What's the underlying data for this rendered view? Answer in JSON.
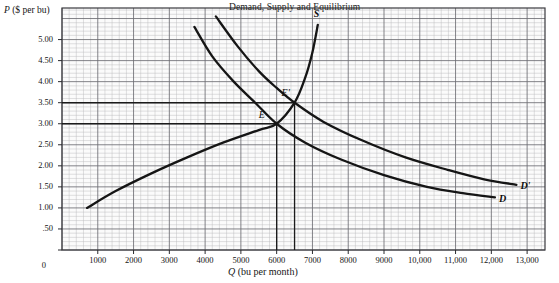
{
  "figure": {
    "title": "Demand, Supply and Equilibrium",
    "background": "#ffffff",
    "grid_fill": "#fbfbfb",
    "grid_minor_color": "#b9b9bd",
    "grid_major_color": "#6d6d72",
    "curve_color": "#151515"
  },
  "chart_data": {
    "type": "line",
    "title": "Demand, Supply and Equilibrium",
    "xlabel": "Q (bu per month)",
    "ylabel": "P ($ per bu)",
    "xlim": [
      0,
      13500
    ],
    "ylim": [
      0,
      5.75
    ],
    "grid": true,
    "legend": "inline-curve-labels",
    "x_ticks": [
      "1000",
      "2000",
      "3000",
      "4000",
      "5000",
      "6000",
      "7000",
      "8000",
      "9000",
      "10,000",
      "11,000",
      "12,000",
      "13,000"
    ],
    "x_tick_values": [
      1000,
      2000,
      3000,
      4000,
      5000,
      6000,
      7000,
      8000,
      9000,
      10000,
      11000,
      12000,
      13000
    ],
    "y_ticks": [
      "0",
      ".50",
      "1.00",
      "1.50",
      "2.00",
      "2.50",
      "3.00",
      "3.50",
      "4.00",
      "4.50",
      "5.00"
    ],
    "y_tick_values": [
      0,
      0.5,
      1.0,
      1.5,
      2.0,
      2.5,
      3.0,
      3.5,
      4.0,
      4.5,
      5.0
    ],
    "series": [
      {
        "name": "S",
        "label": "S",
        "role": "supply",
        "points": [
          [
            700,
            1.0
          ],
          [
            1500,
            1.4
          ],
          [
            2500,
            1.82
          ],
          [
            3500,
            2.2
          ],
          [
            4500,
            2.55
          ],
          [
            5500,
            2.85
          ],
          [
            6000,
            3.0
          ],
          [
            6500,
            3.5
          ],
          [
            6800,
            4.1
          ],
          [
            7000,
            4.7
          ],
          [
            7150,
            5.35
          ]
        ]
      },
      {
        "name": "D",
        "label": "D",
        "role": "demand-original",
        "points": [
          [
            3700,
            5.3
          ],
          [
            4200,
            4.6
          ],
          [
            4800,
            4.0
          ],
          [
            5400,
            3.5
          ],
          [
            6000,
            3.0
          ],
          [
            6800,
            2.55
          ],
          [
            7800,
            2.15
          ],
          [
            9000,
            1.78
          ],
          [
            10200,
            1.5
          ],
          [
            11200,
            1.35
          ],
          [
            12100,
            1.25
          ]
        ]
      },
      {
        "name": "D'",
        "label": "D'",
        "role": "demand-shifted",
        "points": [
          [
            4300,
            5.55
          ],
          [
            4900,
            4.85
          ],
          [
            5500,
            4.25
          ],
          [
            6000,
            3.85
          ],
          [
            6500,
            3.5
          ],
          [
            7300,
            3.05
          ],
          [
            8400,
            2.6
          ],
          [
            9600,
            2.2
          ],
          [
            10800,
            1.9
          ],
          [
            11800,
            1.68
          ],
          [
            12700,
            1.55
          ]
        ]
      }
    ],
    "annotations": [
      {
        "name": "E",
        "label": "E",
        "x": 6000,
        "y": 3.0,
        "note": "original equilibrium"
      },
      {
        "name": "E'",
        "label": "E'",
        "x": 6500,
        "y": 3.5,
        "note": "new equilibrium"
      }
    ],
    "guide_lines": [
      {
        "type": "horizontal",
        "y": 3.0,
        "from_x": 0,
        "to_x": 6000
      },
      {
        "type": "horizontal",
        "y": 3.5,
        "from_x": 0,
        "to_x": 6500
      },
      {
        "type": "vertical",
        "x": 6000,
        "from_y": 0,
        "to_y": 3.0
      },
      {
        "type": "vertical",
        "x": 6500,
        "from_y": 0,
        "to_y": 3.5
      }
    ]
  }
}
